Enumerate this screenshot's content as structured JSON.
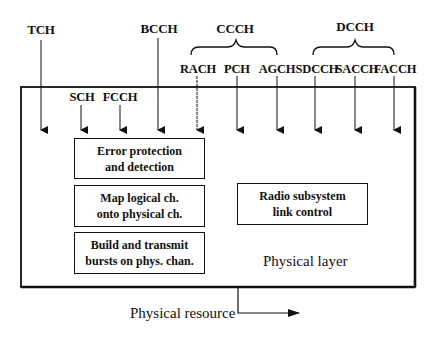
{
  "diagram": {
    "logical_channels": {
      "TCH": "TCH",
      "BCCH": "BCCH",
      "SCH": "SCH",
      "FCCH": "FCCH",
      "RACH": "RACH",
      "PCH": "PCH",
      "AGCH": "AGCH",
      "SDCCH": "SDCCH",
      "SACCH": "SACCH",
      "FACCH": "FACCH"
    },
    "groups": {
      "CCCH": "CCCH",
      "DCCH": "DCCH"
    },
    "boxes": {
      "error_l1": "Error protection",
      "error_l2": "and detection",
      "map_l1": "Map logical ch.",
      "map_l2": "onto physical ch.",
      "build_l1": "Build and transmit",
      "build_l2": "bursts on phys. chan.",
      "radio_l1": "Radio subsystem",
      "radio_l2": "link control"
    },
    "layer_label": "Physical layer",
    "output_label": "Physical resource"
  }
}
